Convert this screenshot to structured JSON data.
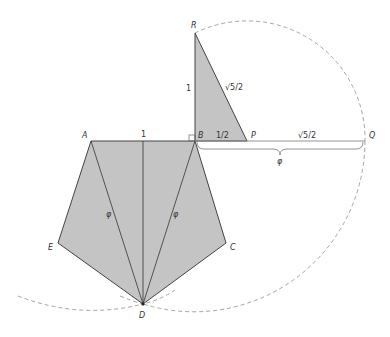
{
  "diagram": {
    "colors": {
      "fill": "#c4c4c4",
      "stroke": "#444444",
      "dash": "#999999"
    },
    "points": {
      "A": {
        "label": "A",
        "x": 91,
        "y": 141
      },
      "B": {
        "label": "B",
        "x": 195,
        "y": 141
      },
      "C": {
        "label": "C",
        "x": 226,
        "y": 243
      },
      "D": {
        "label": "D",
        "x": 143,
        "y": 304
      },
      "E": {
        "label": "E",
        "x": 58,
        "y": 243
      },
      "R": {
        "label": "R",
        "x": 195,
        "y": 33
      },
      "P": {
        "label": "P",
        "x": 247,
        "y": 141
      },
      "Q": {
        "label": "Q",
        "x": 365,
        "y": 141
      }
    },
    "measures": {
      "AB": "1",
      "BR": "1",
      "RP": "√5/2",
      "BP": "1/2",
      "PQ": "√5/2",
      "BQ": "φ",
      "AD": "φ",
      "BD": "φ"
    }
  }
}
